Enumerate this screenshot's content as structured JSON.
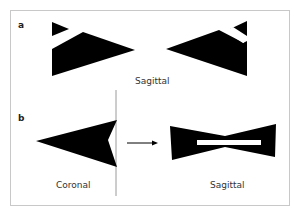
{
  "figure": {
    "panel_a": {
      "label": "a",
      "caption": "Sagittal"
    },
    "panel_b": {
      "label": "b",
      "caption_left": "Coronal",
      "caption_right": "Sagittal"
    },
    "colors": {
      "shape_fill": "#000000",
      "frame_border": "#c8c8c8",
      "divider": "#9a9a9a",
      "text": "#333333"
    }
  }
}
